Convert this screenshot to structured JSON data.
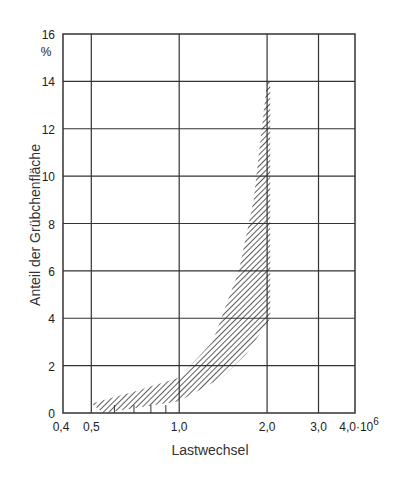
{
  "chart_data": {
    "type": "area",
    "title": "",
    "xlabel": "Lastwechsel",
    "ylabel": "Anteil der Grübchenfläche",
    "y_unit": "%",
    "x_scale": "log",
    "x_range": [
      0.4,
      4.0
    ],
    "x_multiplier": "10^6",
    "y_range": [
      0,
      16
    ],
    "x_ticks": [
      "0,4",
      "0,5",
      "1,0",
      "2,0",
      "3,0",
      "4,0·10^6"
    ],
    "y_ticks": [
      "0",
      "2",
      "4",
      "6",
      "8",
      "10",
      "12",
      "14",
      "16"
    ],
    "grid": true,
    "series": [
      {
        "name": "Streuband (hatched)",
        "upper": {
          "x": [
            0.5,
            0.7,
            1.0,
            1.3,
            1.6,
            1.8,
            2.0,
            2.05
          ],
          "y": [
            0.4,
            0.9,
            1.5,
            3.0,
            6.0,
            9.0,
            14.0,
            14.0
          ]
        },
        "lower": {
          "x": [
            0.55,
            0.7,
            1.0,
            1.4,
            1.7,
            2.0,
            2.05
          ],
          "y": [
            0.0,
            0.2,
            0.5,
            1.5,
            2.5,
            3.8,
            4.0
          ]
        }
      }
    ]
  },
  "labels": {
    "x_ticks": [
      "0,4",
      "0,5",
      "1,0",
      "2,0",
      "3,0",
      "4,0·10"
    ],
    "x_exp": "6",
    "y_ticks": [
      "0",
      "2",
      "4",
      "6",
      "8",
      "10",
      "12",
      "14",
      "16"
    ],
    "y_unit": "%",
    "xlabel": "Lastwechsel",
    "ylabel": "Anteil der Grübchenfläche"
  }
}
